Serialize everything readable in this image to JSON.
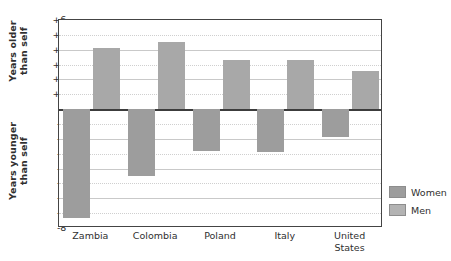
{
  "chart_data": {
    "type": "bar",
    "title": "",
    "subtitle": "",
    "xlabel": "",
    "ylabel": "Years older than self / Years younger than self",
    "categories": [
      "Zambia",
      "Colombia",
      "Poland",
      "Italy",
      "United States"
    ],
    "series": [
      {
        "name": "Men",
        "values": [
          4.1,
          4.5,
          3.3,
          3.3,
          2.6
        ]
      },
      {
        "name": "Women",
        "values": [
          -7.3,
          -4.5,
          -2.8,
          -2.9,
          -1.9
        ]
      }
    ],
    "ylim": [
      -8,
      6
    ],
    "ytick_labels": [
      "+6",
      "+5",
      "+4",
      "+3",
      "+2",
      "+1",
      "0",
      "-1",
      "-2",
      "-3",
      "-4",
      "-5",
      "-6",
      "-7",
      "-8"
    ],
    "ytick_values": [
      6,
      5,
      4,
      3,
      2,
      1,
      0,
      -1,
      -2,
      -3,
      -4,
      -5,
      -6,
      -7,
      -8
    ],
    "grid": true,
    "legend_position": "right"
  },
  "axis_titles": {
    "upper": "Years older\nthan self",
    "lower": "Years younger\nthan self"
  },
  "legend": {
    "items": [
      {
        "label": "Women",
        "color": "#9d9d9d"
      },
      {
        "label": "Men",
        "color": "#b3b3b3"
      }
    ]
  },
  "colors": {
    "men_bar": "#a8a8a8",
    "women_bar": "#9d9d9d",
    "grid": "#c9c9c9",
    "axis": "#444444",
    "zero_line": "#3c3c3c",
    "text": "#2f2f2f"
  }
}
